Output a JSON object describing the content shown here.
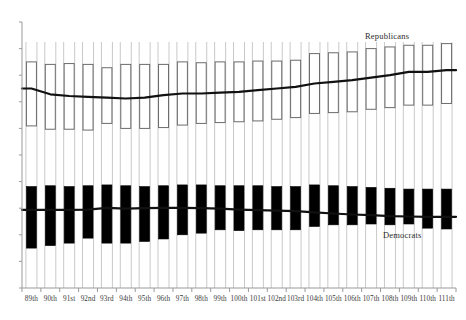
{
  "chart_data": {
    "type": "bar",
    "subtype": "floating-range-bars-with-median-lines",
    "title": "",
    "xlabel": "",
    "ylabel": "",
    "grid": false,
    "legend_position": "inline-annotations",
    "axis": {
      "x_axis_visible": true,
      "y_axis_visible": true,
      "y_tick_labels": [],
      "y_tick_count": 11,
      "x_tick_labels_rotated": false
    },
    "annotations": [
      {
        "text": "Republicans",
        "x": 400,
        "y": 37
      },
      {
        "text": "Democrats",
        "x": 410,
        "y": 236
      }
    ],
    "colors": {
      "republican_fill": "#ffffff",
      "republican_stroke": "#6b6b6b",
      "democrat_fill": "#000000",
      "democrat_stroke": "#000000",
      "median_line": "#111111",
      "whisker": "#c9c9c9",
      "axis": "#9a9a9a",
      "label_text": "#3a3a3a"
    },
    "categories": [
      "89th",
      "90th",
      "91st",
      "92nd",
      "93rd",
      "94th",
      "95th",
      "96th",
      "97th",
      "98th",
      "99th",
      "100th",
      "101st",
      "102nd",
      "103rd",
      "104th",
      "105th",
      "106th",
      "107th",
      "108th",
      "109th",
      "110th",
      "111th"
    ],
    "series": [
      {
        "name": "Republicans",
        "style": "white-box",
        "box_low": [
          0.175,
          0.155,
          0.155,
          0.15,
          0.19,
          0.16,
          0.16,
          0.165,
          0.18,
          0.19,
          0.195,
          0.2,
          0.205,
          0.215,
          0.225,
          0.25,
          0.255,
          0.26,
          0.275,
          0.285,
          0.3,
          0.3,
          0.31
        ],
        "box_high": [
          0.56,
          0.545,
          0.55,
          0.545,
          0.525,
          0.545,
          0.545,
          0.545,
          0.56,
          0.555,
          0.56,
          0.56,
          0.565,
          0.565,
          0.57,
          0.61,
          0.615,
          0.62,
          0.64,
          0.65,
          0.66,
          0.66,
          0.67
        ],
        "median": [
          0.4,
          0.365,
          0.355,
          0.35,
          0.345,
          0.34,
          0.345,
          0.36,
          0.37,
          0.37,
          0.375,
          0.38,
          0.39,
          0.4,
          0.41,
          0.43,
          0.44,
          0.45,
          0.465,
          0.48,
          0.5,
          0.5,
          0.51
        ]
      },
      {
        "name": "Democrats",
        "style": "black-box",
        "box_low": [
          -0.56,
          -0.545,
          -0.53,
          -0.5,
          -0.53,
          -0.53,
          -0.52,
          -0.505,
          -0.48,
          -0.47,
          -0.45,
          -0.455,
          -0.45,
          -0.45,
          -0.45,
          -0.43,
          -0.42,
          -0.42,
          -0.415,
          -0.42,
          -0.415,
          -0.44,
          -0.445
        ],
        "box_high": [
          -0.19,
          -0.185,
          -0.19,
          -0.185,
          -0.18,
          -0.185,
          -0.19,
          -0.185,
          -0.18,
          -0.18,
          -0.185,
          -0.185,
          -0.185,
          -0.19,
          -0.19,
          -0.18,
          -0.185,
          -0.19,
          -0.195,
          -0.2,
          -0.205,
          -0.205,
          -0.205
        ],
        "median": [
          -0.33,
          -0.33,
          -0.33,
          -0.328,
          -0.318,
          -0.322,
          -0.32,
          -0.318,
          -0.318,
          -0.32,
          -0.322,
          -0.328,
          -0.332,
          -0.335,
          -0.338,
          -0.345,
          -0.352,
          -0.358,
          -0.362,
          -0.368,
          -0.37,
          -0.372,
          -0.372
        ]
      }
    ]
  },
  "geometry": {
    "plot_left": 22,
    "plot_right": 456,
    "plot_top": 22,
    "plot_bottom": 288,
    "bar_width": 11,
    "value_top": 0.8,
    "value_bottom": -0.8
  }
}
